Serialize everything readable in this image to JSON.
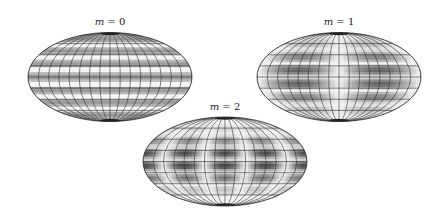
{
  "figure": {
    "panels": [
      {
        "id": "m0",
        "label_var": "m",
        "label_eq": " = 0",
        "m": 0,
        "cx": 110,
        "cy": 77,
        "rx": 82,
        "ry": 44.5,
        "label_x": 110,
        "label_y": 25,
        "pattern": "zonal",
        "bands": [
          {
            "lat": 0.62,
            "shade": "#d4d4d4"
          },
          {
            "lat": 0.38,
            "shade": "#cfcfcf"
          },
          {
            "lat": 0.16,
            "shade": "#dcdcdc"
          },
          {
            "lat": -0.16,
            "shade": "#dcdcdc"
          },
          {
            "lat": -0.38,
            "shade": "#cfcfcf"
          },
          {
            "lat": -0.62,
            "shade": "#d4d4d4"
          }
        ],
        "base_fill": "#f4f4f4"
      },
      {
        "id": "m1",
        "label_var": "m",
        "label_eq": " = 1",
        "m": 1,
        "cx": 339,
        "cy": 77,
        "rx": 82,
        "ry": 44.5,
        "label_x": 339,
        "label_y": 25,
        "pattern": "tesseral",
        "base_fill": "#cfcfcf"
      },
      {
        "id": "m2",
        "label_var": "m",
        "label_eq": " = 2",
        "m": 2,
        "cx": 225,
        "cy": 161.5,
        "rx": 82,
        "ry": 44.5,
        "label_x": 225,
        "label_y": 110,
        "pattern": "tesseral",
        "base_fill": "#d8d8d8"
      }
    ],
    "grid": {
      "meridians": 17,
      "parallels": [
        -0.75,
        -0.5,
        -0.25,
        0,
        0.25,
        0.5,
        0.75
      ],
      "line_color": "#333333"
    }
  }
}
